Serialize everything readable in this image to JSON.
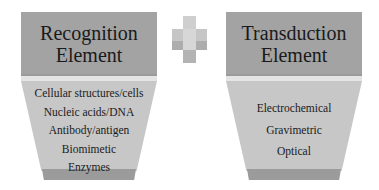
{
  "recognition": {
    "title_line1": "Recognition",
    "title_line2": "Element",
    "items": [
      "Cellular structures/cells",
      "Nucleic acids/DNA",
      "Antibody/antigen",
      "Biomimetic",
      "Enzymes"
    ]
  },
  "operator": {
    "symbol": "plus-icon"
  },
  "transduction": {
    "title_line1": "Transduction",
    "title_line2": "Element",
    "items": [
      "Electrochemical",
      "Gravimetric",
      "Optical"
    ]
  }
}
